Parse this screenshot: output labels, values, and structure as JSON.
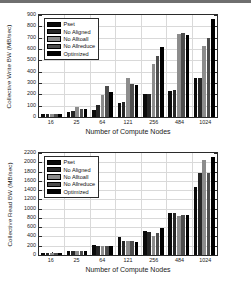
{
  "figure": {
    "top_rule_color": "#6f6f6f",
    "series_colors": [
      "#0a0a0a",
      "#262626",
      "#8c8c8c",
      "#4d4d4d",
      "#000000"
    ],
    "legend_labels": [
      "Pset",
      "No Aligned",
      "No Alltoall",
      "No Allreduce",
      "Optimized"
    ],
    "xlabel": "Number of Compute Nodes",
    "categories": [
      "16",
      "25",
      "64",
      "121",
      "256",
      "484",
      "1024"
    ]
  },
  "chart_data": [
    {
      "type": "bar",
      "title": "",
      "xlabel": "Number of Compute Nodes",
      "ylabel": "Collective Write BW (MB/sec)",
      "categories": [
        "16",
        "25",
        "64",
        "121",
        "256",
        "484",
        "1024"
      ],
      "ylim": [
        0,
        900
      ],
      "yticks": [
        0,
        100,
        200,
        300,
        400,
        500,
        600,
        700,
        800,
        900
      ],
      "grid": true,
      "legend_position": "upper-left",
      "series": [
        {
          "name": "Pset",
          "values": [
            30,
            40,
            60,
            125,
            200,
            232,
            340
          ]
        },
        {
          "name": "No Aligned",
          "values": [
            30,
            52,
            102,
            130,
            205,
            235,
            345
          ]
        },
        {
          "name": "No Alltoall",
          "values": [
            30,
            85,
            190,
            340,
            470,
            735,
            630
          ]
        },
        {
          "name": "No Allreduce",
          "values": [
            30,
            75,
            272,
            290,
            540,
            740,
            700
          ]
        },
        {
          "name": "Optimized",
          "values": [
            30,
            70,
            218,
            280,
            622,
            728,
            868
          ]
        }
      ]
    },
    {
      "type": "bar",
      "title": "",
      "xlabel": "Number of Compute Nodes",
      "ylabel": "Collective Read BW (MB/sec)",
      "categories": [
        "16",
        "25",
        "64",
        "121",
        "256",
        "484",
        "1024"
      ],
      "ylim": [
        0,
        2200
      ],
      "yticks": [
        0,
        200,
        400,
        600,
        800,
        1000,
        1200,
        1400,
        1600,
        1800,
        2000,
        2200
      ],
      "grid": true,
      "legend_position": "upper-left",
      "series": [
        {
          "name": "Pset",
          "values": [
            45,
            85,
            215,
            380,
            520,
            905,
            1470
          ]
        },
        {
          "name": "No Aligned",
          "values": [
            48,
            88,
            205,
            300,
            500,
            900,
            1760
          ]
        },
        {
          "name": "No Alltoall",
          "values": [
            45,
            88,
            195,
            295,
            420,
            840,
            2060
          ]
        },
        {
          "name": "No Allreduce",
          "values": [
            45,
            85,
            200,
            310,
            465,
            865,
            1760
          ]
        },
        {
          "name": "Optimized",
          "values": [
            45,
            85,
            195,
            285,
            585,
            855,
            2120
          ]
        }
      ]
    }
  ]
}
